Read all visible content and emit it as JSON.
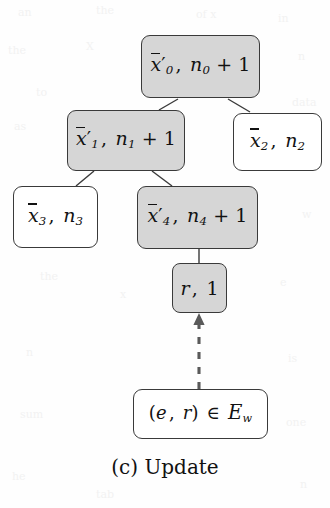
{
  "figure": {
    "caption": "(c) Update",
    "caption_label": "(c)",
    "caption_text": "Update",
    "type": "tree-diagram",
    "background_color": "#fefefe",
    "shaded_fill": "#d6d6d6",
    "unshaded_fill": "#ffffff",
    "stroke_color": "#3a3a3a"
  },
  "nodes": {
    "root": {
      "id": "root",
      "text": "x̄'₀, n₀ + 1",
      "mean_symbol": "x",
      "mean_index": "0",
      "primed": true,
      "count_symbol": "n",
      "count_index": "0",
      "count_increment": "+ 1",
      "shaded": true
    },
    "child_left": {
      "id": "child-left",
      "text": "x̄'₁, n₁ + 1",
      "mean_symbol": "x",
      "mean_index": "1",
      "primed": true,
      "count_symbol": "n",
      "count_index": "1",
      "count_increment": "+ 1",
      "shaded": true
    },
    "child_right": {
      "id": "child-right",
      "text": "x̄₂, n₂",
      "mean_symbol": "x",
      "mean_index": "2",
      "primed": false,
      "count_symbol": "n",
      "count_index": "2",
      "count_increment": "",
      "shaded": false
    },
    "grandchild_left": {
      "id": "grandchild-left",
      "text": "x̄₃, n₃",
      "mean_symbol": "x",
      "mean_index": "3",
      "primed": false,
      "count_symbol": "n",
      "count_index": "3",
      "count_increment": "",
      "shaded": false
    },
    "grandchild_right": {
      "id": "grandchild-right",
      "text": "x̄'₄, n₄ + 1",
      "mean_symbol": "x",
      "mean_index": "4",
      "primed": true,
      "count_symbol": "n",
      "count_index": "4",
      "count_increment": "+ 1",
      "shaded": true
    },
    "leaf_new": {
      "id": "leaf-new",
      "text": "r, 1",
      "value_symbol": "r",
      "count": "1",
      "shaded": true
    },
    "input": {
      "id": "input",
      "text": "(e, r) ∈ 𝓔w",
      "pair_open": "(",
      "pair_first": "e",
      "pair_sep": ",",
      "pair_second": "r",
      "pair_close": ")",
      "relation": "∈",
      "set_symbol": "E",
      "set_subscript": "w",
      "shaded": false
    }
  },
  "edges": [
    {
      "from": "root",
      "to": "child_left",
      "style": "solid"
    },
    {
      "from": "root",
      "to": "child_right",
      "style": "solid"
    },
    {
      "from": "child_left",
      "to": "grandchild_left",
      "style": "solid"
    },
    {
      "from": "child_left",
      "to": "grandchild_right",
      "style": "solid"
    },
    {
      "from": "grandchild_right",
      "to": "leaf_new",
      "style": "solid"
    },
    {
      "from": "input",
      "to": "leaf_new",
      "style": "dashed",
      "arrow": true
    }
  ],
  "bleed": [
    {
      "text": "an",
      "x": 18,
      "y": 6
    },
    {
      "text": "the",
      "x": 96,
      "y": 4
    },
    {
      "text": "of x",
      "x": 196,
      "y": 8
    },
    {
      "text": "in",
      "x": 278,
      "y": 12
    },
    {
      "text": "the",
      "x": 8,
      "y": 44
    },
    {
      "text": "X",
      "x": 86,
      "y": 40
    },
    {
      "text": "n",
      "x": 298,
      "y": 50
    },
    {
      "text": "to",
      "x": 36,
      "y": 86
    },
    {
      "text": "data",
      "x": 292,
      "y": 96
    },
    {
      "text": "as",
      "x": 14,
      "y": 120
    },
    {
      "text": "r",
      "x": 206,
      "y": 184
    },
    {
      "text": "w",
      "x": 302,
      "y": 208
    },
    {
      "text": "the",
      "x": 40,
      "y": 270
    },
    {
      "text": "x",
      "x": 120,
      "y": 288
    },
    {
      "text": "e",
      "x": 280,
      "y": 276
    },
    {
      "text": "n",
      "x": 26,
      "y": 346
    },
    {
      "text": "is",
      "x": 288,
      "y": 352
    },
    {
      "text": "sum",
      "x": 20,
      "y": 408
    },
    {
      "text": "one",
      "x": 286,
      "y": 416
    },
    {
      "text": "he",
      "x": 12,
      "y": 470
    },
    {
      "text": "tab",
      "x": 96,
      "y": 488
    },
    {
      "text": "n",
      "x": 300,
      "y": 478
    }
  ]
}
